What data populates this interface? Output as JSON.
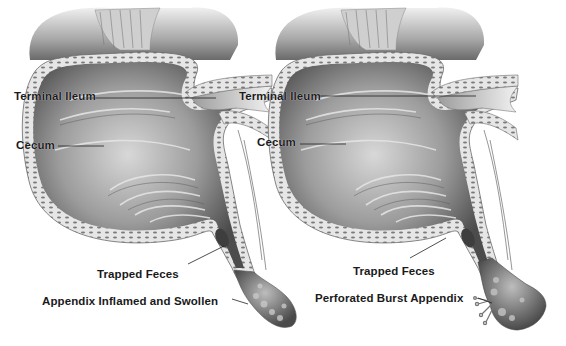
{
  "panels": [
    {
      "id": "left",
      "description": "Inflamed appendix",
      "labels": {
        "terminal_ileum": "Terminal Ileum",
        "cecum": "Cecum",
        "trapped_feces": "Trapped Feces",
        "appendix_state": "Appendix Inflamed and Swollen"
      }
    },
    {
      "id": "right",
      "description": "Burst appendix",
      "labels": {
        "terminal_ileum": "Terminal Ileum",
        "cecum": "Cecum",
        "trapped_feces": "Trapped Feces",
        "appendix_state": "Perforated Burst Appendix"
      }
    }
  ],
  "colors": {
    "background": "#ffffff",
    "tissue_dark": "#4a4a4a",
    "tissue_mid": "#9a9a9a",
    "tissue_light": "#e4e4e4",
    "label_text": "#1a1a1a",
    "leader_line": "#222222"
  }
}
